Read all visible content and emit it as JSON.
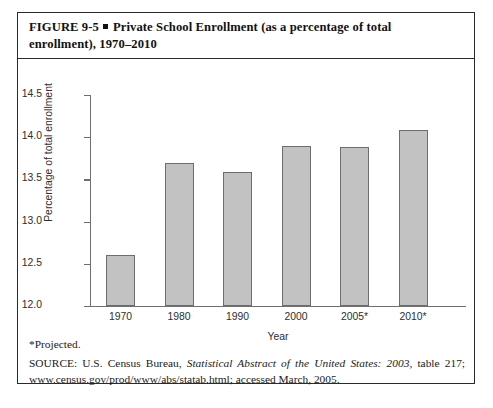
{
  "figure": {
    "label": "FIGURE 9-5",
    "title_part1": "Private School Enrollment (as a percentage of total",
    "title_part2": "enrollment), 1970–2010"
  },
  "footnotes": {
    "projected": "*Projected.",
    "source_prefix": "SOURCE: U.S. Census Bureau, ",
    "source_italic": "Statistical Abstract of the United States: 2003",
    "source_suffix": ", table 217; www.census.gov/prod/www/abs/statab.html; accessed March, 2005."
  },
  "colors": {
    "bar_fill": "#c2c2c2",
    "bar_stroke": "#6d6d6d",
    "axis": "#6f6f6f",
    "border": "#2b2b2b"
  },
  "chart_data": {
    "type": "bar",
    "title": "Private School Enrollment (as a percentage of total enrollment), 1970–2010",
    "xlabel": "Year",
    "ylabel": "Percentage of total enrollment",
    "categories": [
      "1970",
      "1980",
      "1990",
      "2000",
      "2005*",
      "2010*"
    ],
    "values": [
      12.6,
      13.69,
      13.59,
      13.89,
      13.88,
      14.08
    ],
    "ylim": [
      12.0,
      14.5
    ],
    "yticks": [
      "12.0",
      "12.5",
      "13.0",
      "13.5",
      "14.0",
      "14.5"
    ],
    "ytick_values": [
      12.0,
      12.5,
      13.0,
      13.5,
      14.0,
      14.5
    ],
    "grid": false,
    "legend": "none"
  }
}
